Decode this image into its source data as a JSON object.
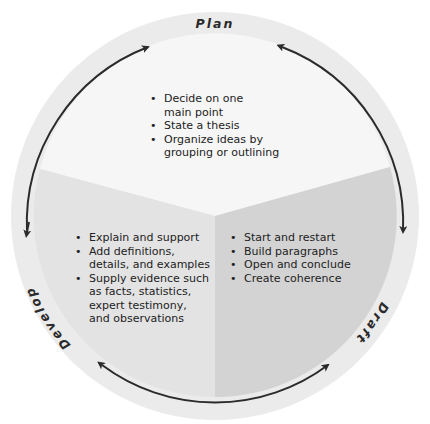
{
  "diagram": {
    "type": "cycle",
    "stages": [
      {
        "name": "Plan",
        "items": [
          "Decide on one main point",
          "State a thesis",
          "Organize ideas by grouping or outlining"
        ]
      },
      {
        "name": "Draft",
        "items": [
          "Start and restart",
          "Build paragraphs",
          "Open and conclude",
          "Create coherence"
        ]
      },
      {
        "name": "Develop",
        "items": [
          "Explain and support",
          "Add definitions, details, and examples",
          "Supply evidence such as facts, statistics, expert testimony, and observations"
        ]
      }
    ],
    "arrows": [
      {
        "from": "Develop",
        "to": "Plan",
        "direction": "clockwise"
      },
      {
        "from": "Plan",
        "to": "Draft",
        "direction": "clockwise"
      },
      {
        "from": "Draft",
        "to": "Develop",
        "direction": "bidirectional"
      },
      {
        "from": "Plan",
        "to": "Develop",
        "direction": "counterclockwise"
      }
    ],
    "colors": {
      "ring": "#e9e9e9",
      "plan_sector": "#f6f6f6",
      "develop_sector": "#e2e2e2",
      "draft_sector": "#d2d2d2",
      "arrow": "#2b2b2b",
      "text": "#222222"
    }
  },
  "plan": {
    "label": "Plan",
    "items": [
      "Decide on one",
      "main point",
      "State a thesis",
      "Organize ideas by",
      "grouping or outlining"
    ]
  },
  "draft": {
    "label": "Draft",
    "items": [
      "Start and restart",
      "Build paragraphs",
      "Open and conclude",
      "Create coherence"
    ]
  },
  "develop": {
    "label": "Develop",
    "items": [
      "Explain and support",
      "Add definitions,",
      "details, and examples",
      "Supply evidence such",
      "as facts, statistics,",
      "expert testimony,",
      "and observations"
    ]
  }
}
